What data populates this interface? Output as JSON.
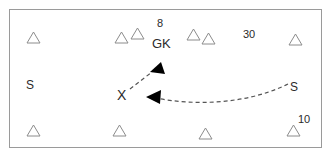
{
  "diagram": {
    "type": "sports-play-diagram",
    "title": "",
    "background_color": "#ffffff",
    "border_color": "#9a9a9a",
    "marker_color": "#8c8c8c",
    "label_color": "#2b2b2b",
    "arrow_color": "#555555",
    "arrowhead_color": "#000000",
    "markers": [
      {
        "name": "triangle-top-left",
        "shape": "triangle",
        "x": 26,
        "y": 31
      },
      {
        "name": "triangle-top-mid-left-1",
        "shape": "triangle",
        "x": 114,
        "y": 31
      },
      {
        "name": "triangle-top-mid-left-2",
        "shape": "triangle",
        "x": 130,
        "y": 27
      },
      {
        "name": "triangle-top-mid-right-1",
        "shape": "triangle",
        "x": 186,
        "y": 28
      },
      {
        "name": "triangle-top-mid-right-2",
        "shape": "triangle",
        "x": 201,
        "y": 32
      },
      {
        "name": "triangle-top-right",
        "shape": "triangle",
        "x": 288,
        "y": 33
      },
      {
        "name": "triangle-bottom-left",
        "shape": "triangle",
        "x": 26,
        "y": 124
      },
      {
        "name": "triangle-bottom-mid-left",
        "shape": "triangle",
        "x": 112,
        "y": 124
      },
      {
        "name": "triangle-bottom-mid",
        "shape": "triangle",
        "x": 198,
        "y": 127
      },
      {
        "name": "triangle-bottom-right",
        "shape": "triangle",
        "x": 286,
        "y": 124
      }
    ],
    "labels": [
      {
        "name": "label-8",
        "text": "8",
        "x": 157,
        "y": 17,
        "style": "lbl-num"
      },
      {
        "name": "label-gk",
        "text": "GK",
        "x": 152,
        "y": 36,
        "style": "lbl-role"
      },
      {
        "name": "label-30",
        "text": "30",
        "x": 243,
        "y": 28,
        "style": "lbl-num"
      },
      {
        "name": "label-10",
        "text": "10",
        "x": 298,
        "y": 113,
        "style": "lbl-num"
      },
      {
        "name": "label-s-left",
        "text": "S",
        "x": 26,
        "y": 78,
        "style": "lbl-s"
      },
      {
        "name": "label-s-right",
        "text": "S",
        "x": 290,
        "y": 80,
        "style": "lbl-s"
      },
      {
        "name": "label-x",
        "text": "X",
        "x": 117,
        "y": 87,
        "style": "lbl-x"
      }
    ],
    "arrows": [
      {
        "name": "arrow-x-to-gk",
        "style": "dashed",
        "path": "M 130 89 L 161 65",
        "head_points": "161,62 150,72 165,74",
        "from": "X",
        "to": "GK"
      },
      {
        "name": "arrow-s-right-to-x",
        "style": "dashed-curved",
        "path": "M 288 84 C 248 104 195 106 156 98",
        "head_points": "146,97 161,90 160,104",
        "from": "S",
        "to": "X"
      }
    ]
  }
}
